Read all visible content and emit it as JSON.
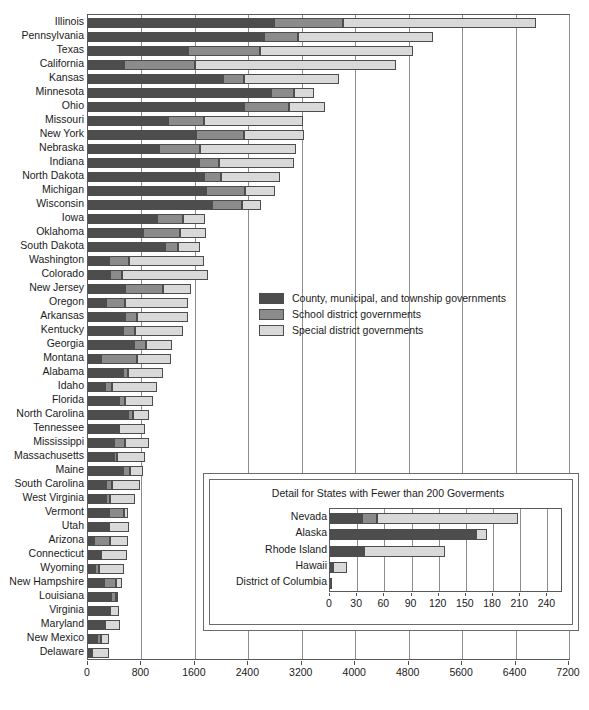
{
  "chart_data": {
    "type": "bar",
    "orientation": "horizontal",
    "stacked": true,
    "title": "",
    "xlabel": "",
    "ylabel": "",
    "xlim": [
      0,
      7200
    ],
    "xticks": [
      0,
      800,
      1600,
      2400,
      3200,
      4000,
      4800,
      5600,
      6400,
      7200
    ],
    "grid": true,
    "legend_position": "center",
    "series": [
      {
        "name": "County, municipal, and township governments",
        "color": "#4d4d4d"
      },
      {
        "name": "School district governments",
        "color": "#8b8b8b"
      },
      {
        "name": "Special district governments",
        "color": "#d9d9d9"
      }
    ],
    "categories": [
      "Illinois",
      "Pennsylvania",
      "Texas",
      "California",
      "Kansas",
      "Minnesota",
      "Ohio",
      "Missouri",
      "New York",
      "Nebraska",
      "Indiana",
      "North Dakota",
      "Michigan",
      "Wisconsin",
      "Iowa",
      "Oklahoma",
      "South Dakota",
      "Washington",
      "Colorado",
      "New Jersey",
      "Oregon",
      "Arkansas",
      "Kentucky",
      "Georgia",
      "Montana",
      "Alabama",
      "Idaho",
      "Florida",
      "North Carolina",
      "Tennessee",
      "Mississippi",
      "Massachusetts",
      "Maine",
      "South Carolina",
      "West Virginia",
      "Vermont",
      "Utah",
      "Arizona",
      "Connecticut",
      "Wyoming",
      "New Hampshire",
      "Louisiana",
      "Virginia",
      "Maryland",
      "New Mexico",
      "Delaware"
    ],
    "values": [
      [
        2790,
        1030,
        2880
      ],
      [
        2630,
        520,
        2010
      ],
      [
        1490,
        1090,
        2290
      ],
      [
        540,
        1060,
        3010
      ],
      [
        2020,
        320,
        1420
      ],
      [
        2740,
        350,
        300
      ],
      [
        2340,
        670,
        540
      ],
      [
        1200,
        540,
        1480
      ],
      [
        1610,
        720,
        900
      ],
      [
        1060,
        610,
        1450
      ],
      [
        1660,
        300,
        1120
      ],
      [
        1730,
        260,
        890
      ],
      [
        1770,
        580,
        450
      ],
      [
        1850,
        450,
        290
      ],
      [
        1040,
        380,
        330
      ],
      [
        820,
        560,
        380
      ],
      [
        1160,
        180,
        340
      ],
      [
        320,
        300,
        1120
      ],
      [
        330,
        180,
        1290
      ],
      [
        560,
        570,
        410
      ],
      [
        270,
        290,
        940
      ],
      [
        560,
        180,
        760
      ],
      [
        520,
        180,
        720
      ],
      [
        690,
        180,
        390
      ],
      [
        190,
        540,
        510
      ],
      [
        520,
        80,
        530
      ],
      [
        250,
        110,
        680
      ],
      [
        470,
        90,
        420
      ],
      [
        600,
        80,
        230
      ],
      [
        440,
        20,
        390
      ],
      [
        390,
        160,
        360
      ],
      [
        390,
        50,
        420
      ],
      [
        530,
        100,
        200
      ],
      [
        270,
        90,
        420
      ],
      [
        270,
        60,
        380
      ],
      [
        310,
        230,
        60
      ],
      [
        280,
        40,
        300
      ],
      [
        90,
        240,
        270
      ],
      [
        180,
        20,
        380
      ],
      [
        100,
        60,
        380
      ],
      [
        240,
        180,
        90
      ],
      [
        350,
        70,
        30
      ],
      [
        330,
        0,
        140
      ],
      [
        250,
        0,
        230
      ],
      [
        140,
        60,
        120
      ],
      [
        60,
        0,
        260
      ]
    ]
  },
  "inset": {
    "title": "Detail for States with Fewer than 200 Goverments",
    "chart_data": {
      "type": "bar",
      "orientation": "horizontal",
      "stacked": true,
      "xlim": [
        0,
        255
      ],
      "xticks": [
        0,
        30,
        60,
        90,
        120,
        150,
        180,
        210,
        240
      ],
      "grid": true,
      "categories": [
        "Nevada",
        "Alaska",
        "Rhode Island",
        "Hawaii",
        "District of Columbia"
      ],
      "values": [
        [
          35,
          17,
          156
        ],
        [
          161,
          0,
          12
        ],
        [
          38,
          0,
          89
        ],
        [
          3,
          0,
          16
        ],
        [
          2,
          0,
          0
        ]
      ]
    }
  }
}
